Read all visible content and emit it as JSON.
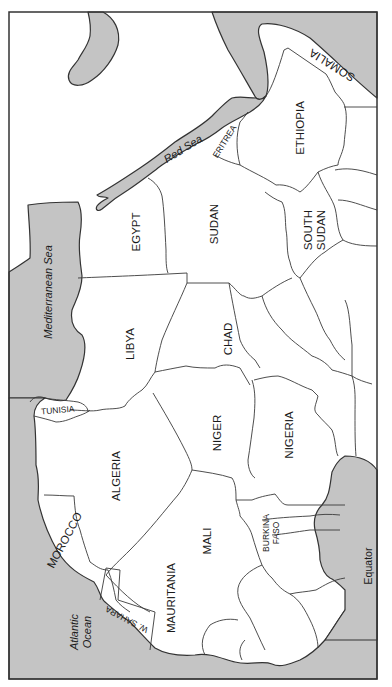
{
  "map": {
    "title": "",
    "orientation": "rotated",
    "colors": {
      "water": "#c4c4c4",
      "land": "#ffffff",
      "border": "#3a3a3a"
    },
    "countries": [
      {
        "id": "egypt",
        "label": "EGYPT"
      },
      {
        "id": "sudan",
        "label": "SUDAN"
      },
      {
        "id": "south-sudan",
        "label_line1": "SOUTH",
        "label_line2": "SUDAN"
      },
      {
        "id": "ethiopia",
        "label": "ETHIOPIA"
      },
      {
        "id": "eritrea",
        "label": "ERITREA"
      },
      {
        "id": "somalia",
        "label": "SOMALIA"
      },
      {
        "id": "libya",
        "label": "LIBYA"
      },
      {
        "id": "chad",
        "label": "CHAD"
      },
      {
        "id": "tunisia",
        "label": "TUNISIA"
      },
      {
        "id": "algeria",
        "label": "ALGERIA"
      },
      {
        "id": "niger",
        "label": "NIGER"
      },
      {
        "id": "nigeria",
        "label": "NIGERIA"
      },
      {
        "id": "morocco",
        "label": "MOROCCO"
      },
      {
        "id": "mali",
        "label": "MALI"
      },
      {
        "id": "burkina-faso",
        "label_line1": "BURKINA",
        "label_line2": "FASO"
      },
      {
        "id": "mauritania",
        "label": "MAURITANIA"
      },
      {
        "id": "w-sahara",
        "label": "W. SAHARA"
      }
    ],
    "water_bodies": [
      {
        "id": "red-sea",
        "label": "Red Sea"
      },
      {
        "id": "mediterranean-sea",
        "label": "Mediterranean Sea"
      },
      {
        "id": "atlantic-ocean",
        "label_line1": "Atlantic",
        "label_line2": "Ocean"
      }
    ],
    "annotations": [
      {
        "id": "equator",
        "label": "Equator"
      }
    ]
  }
}
